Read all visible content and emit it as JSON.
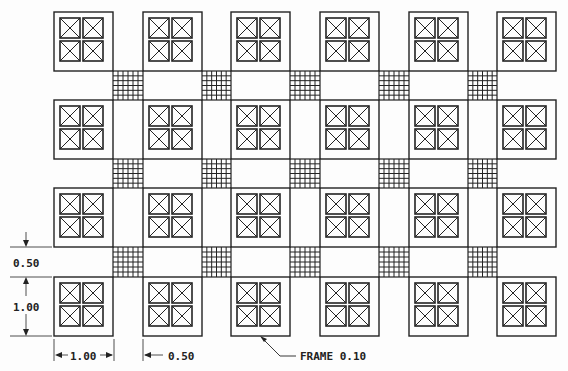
{
  "drawing": {
    "colors": {
      "line": "#222222",
      "background": "#fdfdfd"
    },
    "grid": {
      "columns": 6,
      "rows": 4,
      "block_size_label": "1.00",
      "gap_label": "0.50"
    },
    "blocks": {
      "frame_label": "FRAME 0.10",
      "inner_cells": 4,
      "cell_icon": "crossed-box-icon"
    },
    "mesh": {
      "icon": "mesh-grid-icon",
      "divisions": 5
    },
    "dimensions": {
      "vertical_gap": "0.50",
      "vertical_block": "1.00",
      "horizontal_block": "1.00",
      "horizontal_gap": "0.50"
    },
    "callout": "FRAME 0.10"
  }
}
